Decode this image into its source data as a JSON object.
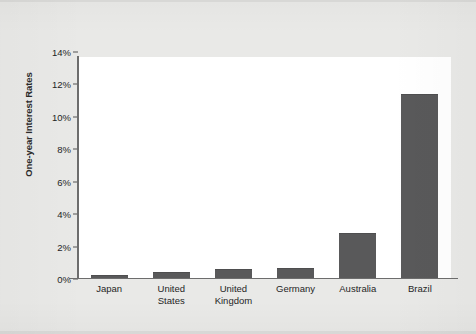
{
  "chart_data": {
    "type": "bar",
    "title": "",
    "subtitle": "",
    "xlabel": "",
    "ylabel": "One-year Interest Rates",
    "categories": [
      "Japan",
      "United States",
      "United Kingdom",
      "Germany",
      "Australia",
      "Brazil"
    ],
    "values": [
      0.1,
      0.3,
      0.5,
      0.6,
      2.8,
      11.6
    ],
    "value_unit": "%",
    "ylim": [
      0,
      14
    ],
    "ytick_values": [
      0,
      2,
      4,
      6,
      8,
      10,
      12,
      14
    ],
    "ytick_labels": [
      "0%",
      "2%",
      "4%",
      "6%",
      "8%",
      "10%",
      "12%",
      "14%"
    ],
    "grid": false,
    "legend": null,
    "legend_position": "none",
    "series": [
      {
        "name": "One-year Interest Rates",
        "values": [
          0.1,
          0.3,
          0.5,
          0.6,
          2.8,
          11.6
        ]
      }
    ],
    "bar_color": "#59595a",
    "plot_background": "#ffffff",
    "page_background": "#e9e9e7",
    "axis_color": "#6d6d6d"
  },
  "axis": {
    "y_title": "One-year Interest Rates",
    "ticks": [
      {
        "label": "14%",
        "value": 14
      },
      {
        "label": "12%",
        "value": 12
      },
      {
        "label": "10%",
        "value": 10
      },
      {
        "label": "8%",
        "value": 8
      },
      {
        "label": "6%",
        "value": 6
      },
      {
        "label": "4%",
        "value": 4
      },
      {
        "label": "2%",
        "value": 2
      },
      {
        "label": "0%",
        "value": 0
      }
    ]
  },
  "categories": [
    {
      "id": "japan",
      "lines": [
        "Japan"
      ],
      "value": 0.1
    },
    {
      "id": "united-states",
      "lines": [
        "United",
        "States"
      ],
      "value": 0.3
    },
    {
      "id": "united-kingdom",
      "lines": [
        "United",
        "Kingdom"
      ],
      "value": 0.5
    },
    {
      "id": "germany",
      "lines": [
        "Germany"
      ],
      "value": 0.6
    },
    {
      "id": "australia",
      "lines": [
        "Australia"
      ],
      "value": 2.8
    },
    {
      "id": "brazil",
      "lines": [
        "Brazil"
      ],
      "value": 11.6
    }
  ],
  "tick_labels": {
    "t14": "14%",
    "t12": "12%",
    "t10": "10%",
    "t8": "8%",
    "t6": "6%",
    "t4": "4%",
    "t2": "2%",
    "t0": "0%"
  },
  "x_labels": {
    "japan_l1": "Japan",
    "us_l1": "United",
    "us_l2": "States",
    "uk_l1": "United",
    "uk_l2": "Kingdom",
    "germany_l1": "Germany",
    "australia_l1": "Australia",
    "brazil_l1": "Brazil"
  }
}
